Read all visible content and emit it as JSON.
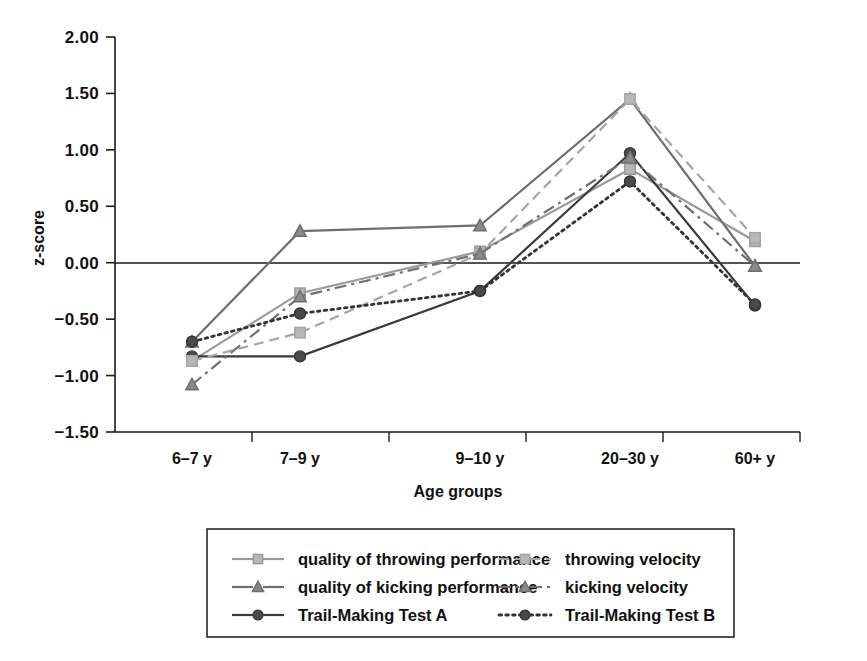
{
  "chart_data": {
    "type": "line",
    "title": "",
    "xlabel": "Age groups",
    "ylabel": "z-score",
    "categories": [
      "6–7 y",
      "7–9 y",
      "9–10 y",
      "20–30 y",
      "60+ y"
    ],
    "ylim": [
      -1.5,
      2.0
    ],
    "ytick_labels": [
      "2.00",
      "1.50",
      "1.00",
      "0.50",
      "0.00",
      "−0.50",
      "−1.00",
      "−1.50"
    ],
    "ytick_values": [
      2.0,
      1.5,
      1.0,
      0.5,
      0.0,
      -0.5,
      -1.0,
      -1.5
    ],
    "grid": false,
    "zero_line": true,
    "legend_position": "bottom",
    "series": [
      {
        "name": "quality of throwing performance",
        "marker": "square",
        "dash": "solid",
        "color": "#9a9a9a",
        "marker_fill": "#b7b7b7",
        "values": [
          -0.87,
          -0.27,
          0.1,
          0.83,
          0.19
        ]
      },
      {
        "name": "quality of kicking performance",
        "marker": "triangle",
        "dash": "solid",
        "color": "#6e6e6e",
        "marker_fill": "#8a8a8a",
        "values": [
          -0.7,
          0.28,
          0.33,
          1.45,
          -0.03
        ]
      },
      {
        "name": "Trail-Making Test A",
        "marker": "circle",
        "dash": "solid",
        "color": "#3a3a3a",
        "marker_fill": "#4a4a4a",
        "values": [
          -0.83,
          -0.83,
          -0.25,
          0.97,
          -0.38
        ]
      },
      {
        "name": "throwing velocity",
        "marker": "square",
        "dash": "dashed",
        "color": "#a5a5a5",
        "marker_fill": "#b7b7b7",
        "values": [
          -0.87,
          -0.62,
          0.08,
          1.45,
          0.22
        ]
      },
      {
        "name": "kicking velocity",
        "marker": "triangle",
        "dash": "dashdot",
        "color": "#707070",
        "marker_fill": "#8a8a8a",
        "values": [
          -1.08,
          -0.3,
          0.08,
          0.93,
          -0.03
        ]
      },
      {
        "name": "Trail-Making Test B",
        "marker": "circle",
        "dash": "dotted",
        "color": "#333333",
        "marker_fill": "#4a4a4a",
        "values": [
          -0.7,
          -0.45,
          -0.25,
          0.72,
          -0.37
        ]
      }
    ]
  },
  "legend": {
    "entries": [
      {
        "label": "quality of throwing performance"
      },
      {
        "label": "throwing velocity"
      },
      {
        "label": "quality of kicking performance"
      },
      {
        "label": "kicking velocity"
      },
      {
        "label": "Trail-Making Test A"
      },
      {
        "label": "Trail-Making Test B"
      }
    ]
  }
}
